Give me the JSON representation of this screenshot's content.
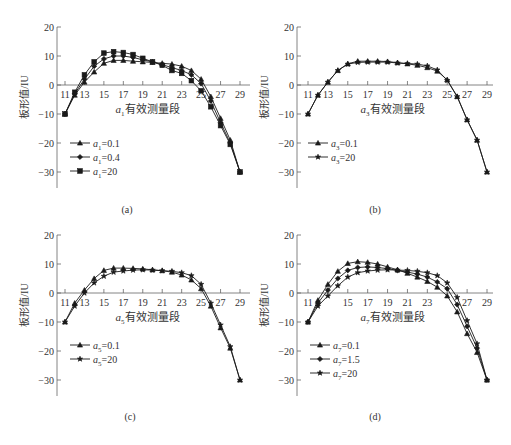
{
  "figure": {
    "captions": [
      "(a)",
      "(b)",
      "(c)",
      "(d)"
    ]
  },
  "chart_data": [
    {
      "type": "line",
      "panel": "(a)",
      "xlabel_var": "a",
      "xlabel_sub": "1",
      "xlabel_text": "有效测量段",
      "ylabel": "板形值/IU",
      "xticks": [
        11,
        13,
        15,
        17,
        19,
        21,
        23,
        25,
        27,
        29
      ],
      "yticks": [
        20,
        10,
        0,
        -10,
        -20,
        -30
      ],
      "ylim": [
        -35,
        20
      ],
      "xlim": [
        11,
        29
      ],
      "x": [
        11,
        12,
        13,
        14,
        15,
        16,
        17,
        18,
        19,
        20,
        21,
        22,
        23,
        24,
        25,
        26,
        27,
        28,
        29
      ],
      "series": [
        {
          "name": "a1=0.1",
          "var": "a",
          "sub": "1",
          "value": "=0.1",
          "marker": "triangle",
          "values": [
            -10,
            -3.5,
            1,
            4.5,
            7.5,
            8.5,
            8.5,
            8.2,
            8.0,
            7.8,
            7.5,
            7.2,
            6.5,
            5,
            2,
            -4,
            -11.5,
            -19,
            -30
          ]
        },
        {
          "name": "a1=0.4",
          "var": "a",
          "sub": "1",
          "value": "=0.4",
          "marker": "diamond",
          "values": [
            -10,
            -3,
            2,
            6.5,
            9,
            10,
            10,
            9.5,
            8.7,
            8,
            7,
            6,
            5,
            3.5,
            0.5,
            -5.5,
            -13,
            -20,
            -30
          ]
        },
        {
          "name": "a1=20",
          "var": "a",
          "sub": "1",
          "value": "=20",
          "marker": "square",
          "values": [
            -10,
            -2.5,
            3.5,
            8,
            11,
            11.5,
            11.2,
            10.5,
            9.2,
            8,
            6.8,
            5,
            4,
            1.5,
            -2,
            -7.5,
            -14,
            -20.5,
            -30
          ]
        }
      ],
      "legend_position": "lower-left"
    },
    {
      "type": "line",
      "panel": "(b)",
      "xlabel_var": "a",
      "xlabel_sub": "3",
      "xlabel_text": "有效测量段",
      "ylabel": "板形值/IU",
      "xticks": [
        11,
        13,
        15,
        17,
        19,
        21,
        23,
        25,
        27,
        29
      ],
      "yticks": [
        20,
        10,
        0,
        -10,
        -20,
        -30
      ],
      "ylim": [
        -35,
        20
      ],
      "xlim": [
        11,
        29
      ],
      "x": [
        11,
        12,
        13,
        14,
        15,
        16,
        17,
        18,
        19,
        20,
        21,
        22,
        23,
        24,
        25,
        26,
        27,
        28,
        29
      ],
      "series": [
        {
          "name": "a3=0.1",
          "var": "a",
          "sub": "3",
          "value": "=0.1",
          "marker": "triangle",
          "values": [
            -10,
            -3.5,
            1,
            5,
            7.3,
            8.2,
            8.2,
            8.2,
            8.1,
            7.7,
            7.3,
            6.8,
            6,
            4.8,
            1.8,
            -4,
            -12,
            -19,
            -30
          ]
        },
        {
          "name": "a3=20",
          "var": "a",
          "sub": "3",
          "value": "=20",
          "marker": "star",
          "values": [
            -10,
            -3.5,
            1,
            5,
            7.2,
            7.8,
            7.9,
            7.9,
            7.9,
            7.6,
            7.4,
            7.2,
            6.6,
            5.2,
            1.6,
            -4,
            -12,
            -19,
            -30
          ]
        }
      ],
      "legend_position": "lower-left"
    },
    {
      "type": "line",
      "panel": "(c)",
      "xlabel_var": "a",
      "xlabel_sub": "5",
      "xlabel_text": "有效测量段",
      "ylabel": "板形值/IU",
      "xticks": [
        11,
        13,
        15,
        17,
        19,
        21,
        23,
        25,
        27,
        29
      ],
      "yticks": [
        20,
        10,
        0,
        -10,
        -20,
        -30
      ],
      "ylim": [
        -35,
        20
      ],
      "xlim": [
        11,
        29
      ],
      "x": [
        11,
        12,
        13,
        14,
        15,
        16,
        17,
        18,
        19,
        20,
        21,
        22,
        23,
        24,
        25,
        26,
        27,
        28,
        29
      ],
      "series": [
        {
          "name": "a5=0.1",
          "var": "a",
          "sub": "5",
          "value": "=0.1",
          "marker": "triangle",
          "values": [
            -10,
            -3.5,
            1,
            5,
            7.8,
            8.6,
            8.6,
            8.5,
            8.3,
            8,
            7.7,
            7.2,
            6.2,
            4.5,
            1.5,
            -4.5,
            -12,
            -19,
            -30
          ]
        },
        {
          "name": "a5=20",
          "var": "a",
          "sub": "5",
          "value": "=20",
          "marker": "star",
          "values": [
            -10,
            -4.5,
            0,
            3.5,
            5.8,
            7.2,
            7.6,
            7.9,
            8,
            7.9,
            7.7,
            7.5,
            7,
            6,
            3,
            -3.5,
            -11,
            -18.5,
            -30
          ]
        }
      ],
      "legend_position": "lower-left"
    },
    {
      "type": "line",
      "panel": "(d)",
      "xlabel_var": "a",
      "xlabel_sub": "7",
      "xlabel_text": "有效测量段",
      "ylabel": "板形值/IU",
      "xticks": [
        11,
        15,
        17,
        19,
        21,
        23,
        27,
        29
      ],
      "yticks": [
        20,
        10,
        0,
        -10,
        -20,
        -30
      ],
      "ylim": [
        -35,
        20
      ],
      "xlim": [
        11,
        29
      ],
      "x": [
        11,
        12,
        13,
        14,
        15,
        16,
        17,
        18,
        19,
        20,
        21,
        22,
        23,
        24,
        25,
        26,
        27,
        28,
        29
      ],
      "series": [
        {
          "name": "a7=0.1",
          "var": "a",
          "sub": "7",
          "value": "=0.1",
          "marker": "triangle",
          "values": [
            -10,
            -2.5,
            3,
            7.5,
            10.2,
            10.8,
            10.6,
            10,
            9,
            8,
            6.8,
            5.5,
            4,
            2,
            -1,
            -6.5,
            -14,
            -20.5,
            -30
          ]
        },
        {
          "name": "a7=1.5",
          "var": "a",
          "sub": "7",
          "value": "=1.5",
          "marker": "diamond",
          "values": [
            -10,
            -3.5,
            1,
            5,
            7.8,
            8.8,
            9,
            8.8,
            8.4,
            7.8,
            7.2,
            6.5,
            5.5,
            3.8,
            1.5,
            -4,
            -11.5,
            -19,
            -30
          ]
        },
        {
          "name": "a7=20",
          "var": "a",
          "sub": "7",
          "value": "=20",
          "marker": "star",
          "values": [
            -10,
            -4.5,
            -1,
            2.5,
            5.5,
            7,
            7.6,
            7.9,
            8,
            7.9,
            7.8,
            7.5,
            7,
            6,
            3.5,
            -1.5,
            -9.5,
            -17.5,
            -30
          ]
        }
      ],
      "legend_position": "lower-left"
    }
  ]
}
